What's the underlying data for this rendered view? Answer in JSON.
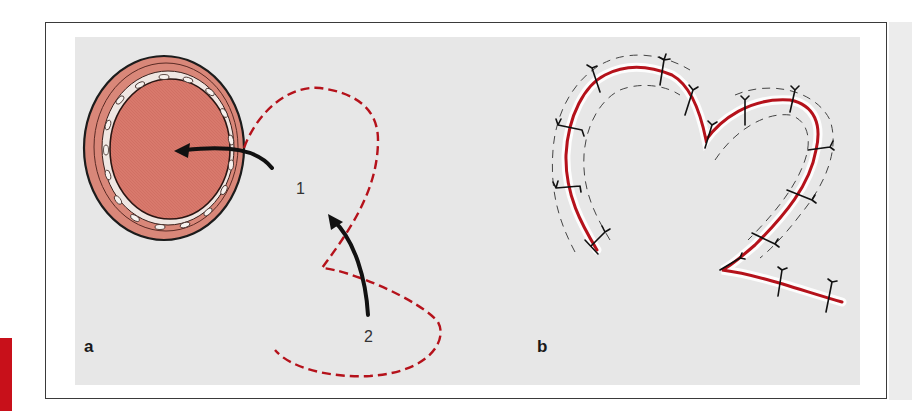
{
  "figure": {
    "panels": [
      {
        "id": "a",
        "label": "a",
        "numbers": [
          {
            "text": "1"
          },
          {
            "text": "2"
          }
        ],
        "description": "Circular wound/ostium with dashed suture path and two directional arrows"
      },
      {
        "id": "b",
        "label": "b",
        "description": "Heart-shaped sutured incision with interrupted stitches along a red line"
      }
    ],
    "colors": {
      "accent_red": "#c8101a",
      "suture_red": "#b5121b",
      "tissue_fill": "#d9776a",
      "panel_bg": "#e7e7e7",
      "frame": "#3a3a3a"
    }
  }
}
